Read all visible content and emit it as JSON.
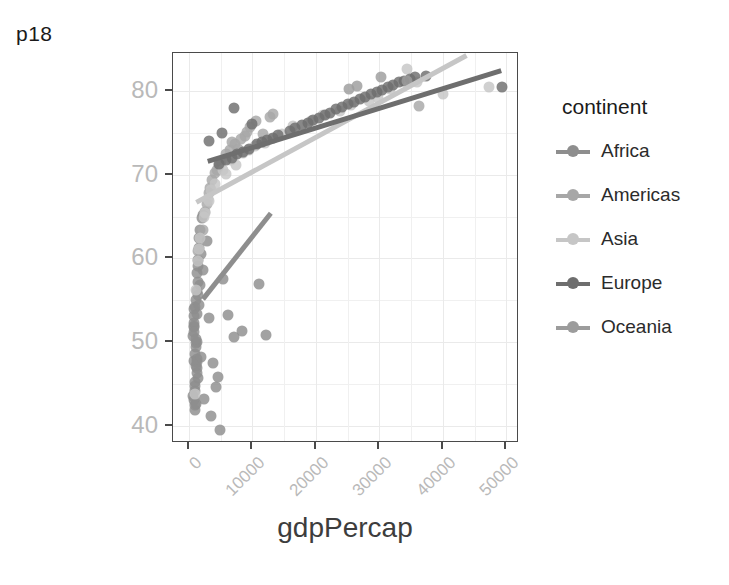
{
  "plot": {
    "title": "p18"
  },
  "chart_data": {
    "type": "scatter",
    "title": "p18",
    "xlabel": "gdpPercap",
    "ylabel": "lifeExp",
    "xlim": [
      -2500,
      52000
    ],
    "ylim": [
      38.0,
      84.5
    ],
    "xticks": [
      "0",
      "10000",
      "20000",
      "30000",
      "40000",
      "50000"
    ],
    "xtick_values": [
      0,
      10000,
      20000,
      30000,
      40000,
      50000
    ],
    "yticks": [
      "40",
      "50",
      "60",
      "70",
      "80"
    ],
    "ytick_values": [
      40,
      50,
      60,
      70,
      80
    ],
    "grid": true,
    "legend": {
      "title": "continent",
      "position": "right",
      "entries": [
        "Africa",
        "Americas",
        "Asia",
        "Europe",
        "Oceania"
      ]
    },
    "colors": {
      "Africa": "#8e8e8e",
      "Americas": "#a7a7a7",
      "Asia": "#c6c6c6",
      "Europe": "#6e6e6e",
      "Oceania": "#9c9c9c"
    },
    "series": [
      {
        "name": "Africa",
        "color": "#8e8e8e",
        "points": [
          [
            1190,
            42.7
          ],
          [
            940,
            45.3
          ],
          [
            760,
            47.8
          ],
          [
            1220,
            50.1
          ],
          [
            880,
            52.3
          ],
          [
            1010,
            54.2
          ],
          [
            690,
            43.6
          ],
          [
            1330,
            46.9
          ],
          [
            1090,
            49.4
          ],
          [
            820,
            51.8
          ],
          [
            1450,
            55.6
          ],
          [
            970,
            44.2
          ],
          [
            1150,
            47.2
          ],
          [
            720,
            50.7
          ],
          [
            1280,
            53.4
          ],
          [
            900,
            41.9
          ],
          [
            1390,
            45.8
          ],
          [
            1040,
            48.6
          ],
          [
            790,
            52.0
          ],
          [
            1210,
            56.1
          ],
          [
            860,
            43.1
          ],
          [
            1320,
            46.4
          ],
          [
            1130,
            49.9
          ],
          [
            740,
            54.0
          ],
          [
            1480,
            57.2
          ],
          [
            990,
            42.5
          ],
          [
            1260,
            48.0
          ],
          [
            810,
            51.2
          ],
          [
            1170,
            55.0
          ],
          [
            930,
            44.8
          ],
          [
            1350,
            47.6
          ],
          [
            1060,
            50.4
          ],
          [
            770,
            53.1
          ],
          [
            1230,
            58.3
          ],
          [
            1410,
            59.8
          ],
          [
            1530,
            61.2
          ],
          [
            1650,
            62.5
          ],
          [
            1780,
            63.4
          ],
          [
            2050,
            64.8
          ],
          [
            1900,
            60.5
          ],
          [
            2300,
            65.2
          ],
          [
            2150,
            58.6
          ],
          [
            1710,
            56.8
          ],
          [
            1590,
            54.5
          ],
          [
            1460,
            59.1
          ],
          [
            3200,
            52.9
          ],
          [
            3850,
            47.5
          ],
          [
            4300,
            44.7
          ],
          [
            3550,
            41.2
          ],
          [
            4900,
            39.6
          ],
          [
            6200,
            53.3
          ],
          [
            7100,
            50.6
          ],
          [
            8400,
            51.4
          ],
          [
            11100,
            56.9
          ],
          [
            12200,
            50.9
          ],
          [
            5400,
            57.5
          ],
          [
            4650,
            45.9
          ],
          [
            2850,
            62.1
          ],
          [
            2420,
            43.3
          ],
          [
            1870,
            48.3
          ]
        ]
      },
      {
        "name": "Americas",
        "color": "#a7a7a7",
        "points": [
          [
            1470,
            60.9
          ],
          [
            2600,
            65.6
          ],
          [
            3200,
            67.8
          ],
          [
            4100,
            70.2
          ],
          [
            5100,
            71.5
          ],
          [
            6400,
            72.9
          ],
          [
            7300,
            73.6
          ],
          [
            8200,
            74.3
          ],
          [
            9100,
            75.1
          ],
          [
            10600,
            76.4
          ],
          [
            11700,
            74.8
          ],
          [
            12800,
            76.9
          ],
          [
            3700,
            69.3
          ],
          [
            4800,
            71.0
          ],
          [
            5900,
            72.4
          ],
          [
            7700,
            73.1
          ],
          [
            2900,
            66.5
          ],
          [
            6800,
            73.9
          ],
          [
            9700,
            75.7
          ],
          [
            13300,
            77.2
          ],
          [
            36300,
            78.2
          ],
          [
            8900,
            74.6
          ],
          [
            4400,
            70.6
          ],
          [
            3400,
            68.4
          ],
          [
            2200,
            63.4
          ]
        ]
      },
      {
        "name": "Asia",
        "color": "#c6c6c6",
        "points": [
          [
            944,
            43.8
          ],
          [
            1390,
            59.7
          ],
          [
            1800,
            62.4
          ],
          [
            2430,
            64.9
          ],
          [
            3200,
            66.8
          ],
          [
            4100,
            68.9
          ],
          [
            5300,
            70.6
          ],
          [
            6700,
            71.8
          ],
          [
            8500,
            72.6
          ],
          [
            10400,
            73.4
          ],
          [
            12800,
            74.2
          ],
          [
            16400,
            75.8
          ],
          [
            21100,
            77.1
          ],
          [
            25500,
            78.3
          ],
          [
            29800,
            79.1
          ],
          [
            31700,
            80.2
          ],
          [
            34400,
            82.6
          ],
          [
            47300,
            80.4
          ],
          [
            40100,
            79.6
          ],
          [
            2600,
            65.4
          ],
          [
            1650,
            61.1
          ],
          [
            7500,
            71.2
          ],
          [
            14600,
            74.9
          ],
          [
            19300,
            76.4
          ],
          [
            28300,
            78.8
          ],
          [
            1140,
            56.2
          ],
          [
            2980,
            67.1
          ],
          [
            5800,
            70.1
          ],
          [
            9400,
            72.9
          ],
          [
            23800,
            77.6
          ],
          [
            36000,
            81.0
          ],
          [
            12000,
            73.8
          ],
          [
            3500,
            68.2
          ]
        ]
      },
      {
        "name": "Europe",
        "color": "#6e6e6e",
        "points": [
          [
            5900,
            71.8
          ],
          [
            7600,
            72.4
          ],
          [
            9400,
            73.0
          ],
          [
            10800,
            73.6
          ],
          [
            12300,
            74.1
          ],
          [
            14100,
            74.7
          ],
          [
            15900,
            75.2
          ],
          [
            17800,
            75.9
          ],
          [
            19600,
            76.5
          ],
          [
            21400,
            77.1
          ],
          [
            23200,
            77.8
          ],
          [
            25100,
            78.4
          ],
          [
            26900,
            79.0
          ],
          [
            28700,
            79.6
          ],
          [
            30400,
            80.1
          ],
          [
            32200,
            80.7
          ],
          [
            33900,
            81.2
          ],
          [
            35600,
            81.6
          ],
          [
            37400,
            81.8
          ],
          [
            49400,
            80.5
          ],
          [
            4700,
            71.3
          ],
          [
            6800,
            72.0
          ],
          [
            8500,
            72.7
          ],
          [
            11500,
            73.9
          ],
          [
            13200,
            74.4
          ],
          [
            16700,
            75.5
          ],
          [
            18700,
            76.2
          ],
          [
            20500,
            76.8
          ],
          [
            22300,
            77.4
          ],
          [
            24100,
            78.1
          ],
          [
            26000,
            78.7
          ],
          [
            27800,
            79.3
          ],
          [
            29600,
            79.9
          ],
          [
            31300,
            80.4
          ],
          [
            33100,
            81.0
          ],
          [
            34800,
            81.4
          ],
          [
            3100,
            74.0
          ],
          [
            9900,
            76.0
          ],
          [
            7100,
            78.0
          ],
          [
            5200,
            75.0
          ]
        ]
      },
      {
        "name": "Oceania",
        "color": "#9c9c9c",
        "points": [
          [
            34400,
            81.2
          ],
          [
            25200,
            80.2
          ],
          [
            30200,
            81.6
          ],
          [
            26500,
            80.6
          ]
        ]
      }
    ],
    "trend_lines": [
      {
        "name": "Africa",
        "color": "#8e8e8e",
        "x": [
          2250,
          13000
        ],
        "y": [
          55.0,
          65.3
        ]
      },
      {
        "name": "Asia",
        "color": "#c6c6c6",
        "x": [
          1200,
          44000
        ],
        "y": [
          66.6,
          84.2
        ]
      },
      {
        "name": "Europe",
        "color": "#6e6e6e",
        "x": [
          3000,
          49500
        ],
        "y": [
          71.5,
          82.4
        ]
      }
    ]
  }
}
